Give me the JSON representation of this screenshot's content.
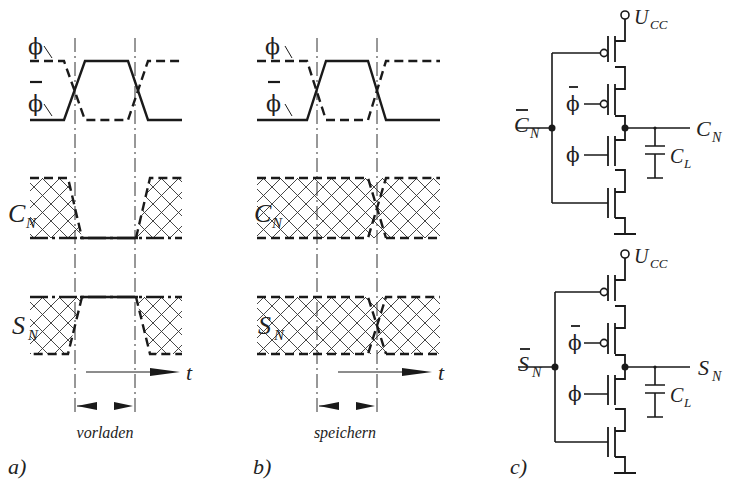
{
  "figure": {
    "panels": [
      {
        "id": "a",
        "label": "a)",
        "caption": "vorladen",
        "signals": {
          "phi": "ϕ",
          "phi_bar": "ϕ",
          "cn": "C",
          "cn_sub": "N",
          "sn": "S",
          "sn_sub": "N"
        },
        "time_axis": "t"
      },
      {
        "id": "b",
        "label": "b)",
        "caption": "speichern",
        "signals": {
          "phi": "ϕ",
          "phi_bar": "ϕ",
          "cn": "C",
          "cn_sub": "N",
          "sn": "S",
          "sn_sub": "N"
        },
        "time_axis": "t"
      },
      {
        "id": "c",
        "label": "c)",
        "circuits": [
          {
            "supply": "U",
            "supply_sub": "CC",
            "input": "C",
            "input_sub": "N",
            "input_overbar": true,
            "output": "C",
            "output_sub": "N",
            "gate_phi_bar": "ϕ",
            "gate_phi": "ϕ",
            "cap": "C",
            "cap_sub": "L"
          },
          {
            "supply": "U",
            "supply_sub": "CC",
            "input": "S",
            "input_sub": "N",
            "input_overbar": true,
            "output": "S",
            "output_sub": "N",
            "gate_phi_bar": "ϕ",
            "gate_phi": "ϕ",
            "cap": "C",
            "cap_sub": "L"
          }
        ]
      }
    ]
  }
}
